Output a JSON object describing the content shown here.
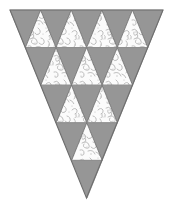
{
  "figure": {
    "title": "Inverted subdivided triangle",
    "canvas": {
      "width": 171,
      "height": 207
    },
    "colors": {
      "background": "#ffffff",
      "gray_fill": "#969696",
      "gray_fill_light": "#a0a0a0",
      "texture_base": "#fbfbfb",
      "texture_speck": "#b9b9b9",
      "outline": "#6e6e6e",
      "outline_light": "#8c8c8c"
    },
    "geometry": {
      "apex_x": 87,
      "apex_y": 198,
      "top_left_x": 10,
      "top_right_x": 163,
      "top_y": 10,
      "rows": 5,
      "cell_width": 38.25,
      "cell_height": 47
    },
    "rows": [
      {
        "index": 1,
        "textured_count": 4,
        "gray_count": 5
      },
      {
        "index": 2,
        "textured_count": 3,
        "gray_count": 4
      },
      {
        "index": 3,
        "textured_count": 2,
        "gray_count": 3
      },
      {
        "index": 4,
        "textured_count": 1,
        "gray_count": 2
      },
      {
        "index": 5,
        "textured_count": 0,
        "gray_count": 1
      }
    ],
    "totals": {
      "textured_triangles": 10,
      "gray_triangles": 15,
      "total_triangles": 25
    }
  }
}
